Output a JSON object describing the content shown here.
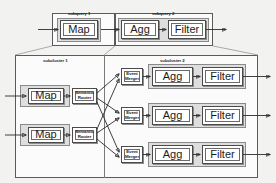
{
  "diagram": {
    "colors": {
      "background": "#f2f2f0",
      "panel_fill": "#fbfbfb",
      "group_fill": "#dedede",
      "node_fill": "#ffffff",
      "stroke": "#2b2b2b",
      "guide_stroke": "#8b8b8b"
    }
  },
  "top_section": {
    "subquery1": {
      "title": "subquery 1",
      "nodes": [
        {
          "label": "Map",
          "name": "map-node"
        }
      ]
    },
    "subquery2": {
      "title": "subquery 2",
      "nodes": [
        {
          "label": "Agg",
          "name": "agg-node"
        },
        {
          "label": "Filter",
          "name": "filter-node"
        }
      ]
    }
  },
  "bottom_section": {
    "subcluster1": {
      "title": "subcluster 1",
      "rows": [
        {
          "map": "Map",
          "router": "Semantic Router"
        },
        {
          "map": "Map",
          "router": "Semantic Router"
        }
      ]
    },
    "subcluster2": {
      "title": "subcluster 2",
      "rows": [
        {
          "merger": "Event Merger",
          "agg": "Agg",
          "filter": "Filter"
        },
        {
          "merger": "Event Merger",
          "agg": "Agg",
          "filter": "Filter"
        },
        {
          "merger": "Event Merger",
          "agg": "Agg",
          "filter": "Filter"
        }
      ]
    }
  },
  "labels": {
    "map": "Map",
    "agg": "Agg",
    "filter": "Filter",
    "semantic_router_line1": "Semantic",
    "semantic_router_line2": "Router",
    "event_merger_line1": "Event",
    "event_merger_line2": "Merger"
  }
}
